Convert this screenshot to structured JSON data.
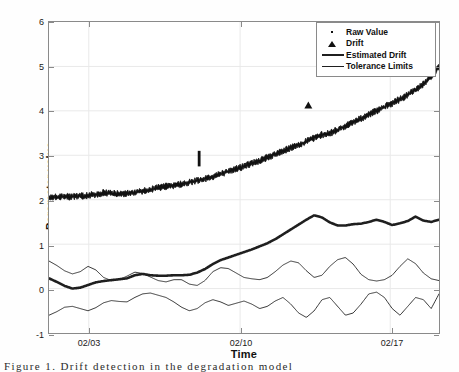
{
  "figure": {
    "caption": "Figure 1.   Drift detection in the degradation model"
  },
  "axes": {
    "xlabel": "Time",
    "ylabel": "Parameter value",
    "yticks": [
      "-1",
      "0",
      "1",
      "2",
      "3",
      "4",
      "5",
      "6"
    ],
    "xticks": [
      "02/03",
      "02/10",
      "02/17"
    ]
  },
  "legend": {
    "items": [
      {
        "label": "Raw Value",
        "marker": "dot-marker",
        "color": "#111111"
      },
      {
        "label": "Drift",
        "marker": "triangle-marker",
        "color": "#111111"
      },
      {
        "label": "Estimated Drift",
        "marker": "thick-line",
        "color": "#1f1f1f"
      },
      {
        "label": "Tolerance Limits",
        "marker": "thin-line",
        "color": "#1f1f1f"
      }
    ]
  },
  "chart_data": {
    "type": "line",
    "title": "",
    "xlabel": "Time",
    "ylabel": "Parameter value",
    "xlim": [
      0,
      100
    ],
    "ylim": [
      -1,
      6
    ],
    "grid": true,
    "xtick_labels": [
      "02/03",
      "02/10",
      "02/17"
    ],
    "xtick_positions": [
      10.2,
      49.0,
      87.5
    ],
    "ytick_values": [
      -1,
      0,
      1,
      2,
      3,
      4,
      5,
      6
    ],
    "legend_position": "upper-right",
    "series": [
      {
        "name": "Raw Value",
        "style": "noisy-band",
        "color": "#111111",
        "x": [
          0,
          2,
          4,
          6,
          8,
          10,
          12,
          14,
          16,
          18,
          20,
          22,
          24,
          26,
          28,
          30,
          32,
          34,
          36,
          38,
          40,
          42,
          44,
          46,
          48,
          50,
          52,
          54,
          56,
          58,
          60,
          62,
          64,
          66,
          68,
          70,
          72,
          74,
          76,
          78,
          80,
          82,
          84,
          86,
          88,
          90,
          92,
          94,
          96,
          98,
          100
        ],
        "values": [
          2.05,
          2.06,
          2.07,
          2.07,
          2.08,
          2.09,
          2.12,
          2.16,
          2.14,
          2.13,
          2.14,
          2.16,
          2.19,
          2.22,
          2.27,
          2.3,
          2.32,
          2.35,
          2.39,
          2.43,
          2.47,
          2.52,
          2.58,
          2.63,
          2.7,
          2.75,
          2.82,
          2.88,
          2.95,
          3.02,
          3.09,
          3.17,
          3.24,
          3.31,
          3.39,
          3.46,
          3.5,
          3.57,
          3.66,
          3.75,
          3.83,
          3.92,
          4.0,
          4.09,
          4.17,
          4.26,
          4.36,
          4.48,
          4.6,
          4.76,
          5.0
        ],
        "band_halfwidth": 0.045,
        "spike": {
          "x": 38.5,
          "value": 3.1
        }
      },
      {
        "name": "Drift",
        "style": "triangle-markers",
        "color": "#111111",
        "points": [
          {
            "x": 66.5,
            "value": 4.12
          }
        ]
      },
      {
        "name": "Estimated Drift",
        "style": "thick-line",
        "color": "#1f1f1f",
        "x": [
          0,
          2,
          4,
          6,
          8,
          10,
          12,
          14,
          16,
          18,
          20,
          22,
          24,
          26,
          28,
          30,
          32,
          34,
          36,
          38,
          40,
          42,
          44,
          46,
          48,
          50,
          52,
          54,
          56,
          58,
          60,
          62,
          64,
          66,
          68,
          70,
          72,
          74,
          76,
          78,
          80,
          82,
          84,
          86,
          88,
          90,
          92,
          94,
          96,
          98,
          100
        ],
        "values": [
          0.23,
          0.15,
          0.06,
          0.0,
          0.02,
          0.08,
          0.14,
          0.17,
          0.19,
          0.21,
          0.23,
          0.3,
          0.33,
          0.3,
          0.29,
          0.29,
          0.3,
          0.3,
          0.31,
          0.36,
          0.44,
          0.55,
          0.64,
          0.7,
          0.76,
          0.82,
          0.88,
          0.95,
          1.02,
          1.11,
          1.22,
          1.33,
          1.44,
          1.55,
          1.65,
          1.6,
          1.49,
          1.42,
          1.42,
          1.45,
          1.46,
          1.5,
          1.55,
          1.5,
          1.43,
          1.47,
          1.52,
          1.62,
          1.53,
          1.5,
          1.55
        ]
      },
      {
        "name": "Tolerance Limits (upper)",
        "style": "thin-line",
        "color": "#1f1f1f",
        "x": [
          0,
          2,
          4,
          6,
          8,
          10,
          12,
          14,
          16,
          18,
          20,
          22,
          24,
          26,
          28,
          30,
          32,
          34,
          36,
          38,
          40,
          42,
          44,
          46,
          48,
          50,
          52,
          54,
          56,
          58,
          60,
          62,
          64,
          66,
          68,
          70,
          72,
          74,
          76,
          78,
          80,
          82,
          84,
          86,
          88,
          90,
          92,
          94,
          96,
          98,
          100
        ],
        "values": [
          0.62,
          0.52,
          0.4,
          0.33,
          0.38,
          0.5,
          0.42,
          0.25,
          0.18,
          0.2,
          0.28,
          0.37,
          0.34,
          0.26,
          0.18,
          0.15,
          0.2,
          0.2,
          0.1,
          0.07,
          0.18,
          0.38,
          0.47,
          0.45,
          0.35,
          0.25,
          0.22,
          0.2,
          0.25,
          0.38,
          0.53,
          0.62,
          0.58,
          0.4,
          0.25,
          0.3,
          0.5,
          0.65,
          0.7,
          0.55,
          0.32,
          0.2,
          0.17,
          0.2,
          0.3,
          0.5,
          0.67,
          0.56,
          0.35,
          0.22,
          0.18
        ]
      },
      {
        "name": "Tolerance Limits (lower)",
        "style": "thin-line",
        "color": "#1f1f1f",
        "x": [
          0,
          2,
          4,
          6,
          8,
          10,
          12,
          14,
          16,
          18,
          20,
          22,
          24,
          26,
          28,
          30,
          32,
          34,
          36,
          38,
          40,
          42,
          44,
          46,
          48,
          50,
          52,
          54,
          56,
          58,
          60,
          62,
          64,
          66,
          68,
          70,
          72,
          74,
          76,
          78,
          80,
          82,
          84,
          86,
          88,
          90,
          92,
          94,
          96,
          98,
          100
        ],
        "values": [
          -0.6,
          -0.52,
          -0.42,
          -0.4,
          -0.45,
          -0.5,
          -0.43,
          -0.32,
          -0.27,
          -0.29,
          -0.3,
          -0.2,
          -0.12,
          -0.1,
          -0.15,
          -0.2,
          -0.3,
          -0.42,
          -0.5,
          -0.45,
          -0.32,
          -0.25,
          -0.3,
          -0.38,
          -0.33,
          -0.28,
          -0.35,
          -0.45,
          -0.4,
          -0.28,
          -0.2,
          -0.35,
          -0.55,
          -0.65,
          -0.5,
          -0.25,
          -0.2,
          -0.4,
          -0.6,
          -0.55,
          -0.35,
          -0.12,
          -0.08,
          -0.2,
          -0.45,
          -0.6,
          -0.4,
          -0.2,
          -0.25,
          -0.45,
          -0.12
        ]
      }
    ]
  }
}
